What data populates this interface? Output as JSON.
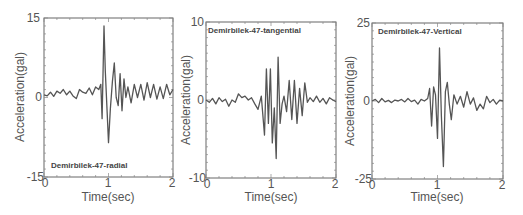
{
  "figure": {
    "background": "#ffffff",
    "line_color": "#555555"
  },
  "chart_data": [
    {
      "type": "line",
      "title": "Demirbilek-47-radial",
      "title_position": "bottom-left",
      "xlabel": "Time(sec)",
      "ylabel": "Acceleration(gal)",
      "xlim": [
        0,
        2
      ],
      "ylim": [
        -15,
        15
      ],
      "xticks": [
        "0",
        "1",
        "2"
      ],
      "yticks": [
        "-15",
        "0",
        "15"
      ],
      "grid": false,
      "x": [
        0.0,
        0.05,
        0.1,
        0.15,
        0.2,
        0.25,
        0.3,
        0.35,
        0.4,
        0.45,
        0.5,
        0.55,
        0.6,
        0.65,
        0.7,
        0.75,
        0.8,
        0.85,
        0.88,
        0.9,
        0.93,
        0.95,
        0.98,
        1.0,
        1.03,
        1.06,
        1.09,
        1.12,
        1.15,
        1.18,
        1.21,
        1.24,
        1.27,
        1.3,
        1.35,
        1.4,
        1.45,
        1.5,
        1.55,
        1.6,
        1.65,
        1.7,
        1.75,
        1.8,
        1.85,
        1.9,
        1.95,
        2.0
      ],
      "y": [
        0.5,
        0.3,
        1.0,
        0.2,
        1.2,
        0.8,
        1.5,
        0.5,
        1.2,
        0.3,
        -0.2,
        1.5,
        1.0,
        0.8,
        1.8,
        0.5,
        2.0,
        1.5,
        2.5,
        -4.0,
        13.5,
        5.0,
        -3.0,
        -8.5,
        -2.0,
        3.0,
        6.5,
        0.0,
        -1.5,
        4.5,
        -2.5,
        3.5,
        0.0,
        2.0,
        -1.0,
        2.5,
        0.0,
        2.5,
        -0.5,
        2.8,
        0.0,
        2.5,
        -0.3,
        2.0,
        -0.2,
        2.5,
        0.5,
        1.5
      ]
    },
    {
      "type": "line",
      "title": "Demirbilek-47-tangential",
      "title_position": "top-left",
      "xlabel": "Time(sec)",
      "ylabel": "Acceleration(gal)",
      "xlim": [
        0,
        2
      ],
      "ylim": [
        -10,
        10
      ],
      "xticks": [
        "0",
        "1",
        "2"
      ],
      "yticks": [
        "-10",
        "0",
        "10"
      ],
      "grid": false,
      "x": [
        0.0,
        0.05,
        0.1,
        0.15,
        0.2,
        0.25,
        0.3,
        0.35,
        0.4,
        0.45,
        0.5,
        0.55,
        0.6,
        0.65,
        0.7,
        0.75,
        0.8,
        0.85,
        0.9,
        0.93,
        0.96,
        0.99,
        1.02,
        1.05,
        1.08,
        1.11,
        1.14,
        1.17,
        1.2,
        1.24,
        1.28,
        1.32,
        1.36,
        1.4,
        1.44,
        1.48,
        1.52,
        1.56,
        1.6,
        1.65,
        1.7,
        1.75,
        1.8,
        1.85,
        1.9,
        1.95,
        2.0
      ],
      "y": [
        0.0,
        -0.3,
        0.2,
        -0.5,
        0.3,
        -0.2,
        0.1,
        -0.8,
        0.0,
        -0.3,
        0.8,
        0.3,
        0.5,
        0.0,
        0.3,
        -0.5,
        -1.2,
        0.5,
        -4.5,
        4.0,
        -3.0,
        4.0,
        -5.5,
        -1.0,
        -7.5,
        5.5,
        -3.0,
        -0.5,
        0.5,
        -1.5,
        2.5,
        -2.5,
        2.5,
        -3.0,
        1.5,
        -2.0,
        2.2,
        -0.3,
        0.3,
        -0.2,
        0.5,
        -0.3,
        0.2,
        -0.5,
        0.3,
        0.0,
        -0.2
      ]
    },
    {
      "type": "line",
      "title": "Demirbilek-47-Vertical",
      "title_position": "top-left",
      "xlabel": "Time(sec)",
      "ylabel": "Acceleration(gal)",
      "xlim": [
        0,
        2
      ],
      "ylim": [
        -25,
        25
      ],
      "xticks": [
        "0",
        "1",
        "2"
      ],
      "yticks": [
        "-25",
        "0",
        "25"
      ],
      "grid": false,
      "x": [
        0.0,
        0.05,
        0.1,
        0.15,
        0.2,
        0.25,
        0.3,
        0.35,
        0.4,
        0.45,
        0.5,
        0.55,
        0.6,
        0.65,
        0.7,
        0.75,
        0.8,
        0.85,
        0.88,
        0.91,
        0.94,
        0.97,
        1.0,
        1.03,
        1.06,
        1.09,
        1.12,
        1.15,
        1.18,
        1.21,
        1.25,
        1.3,
        1.35,
        1.4,
        1.45,
        1.5,
        1.55,
        1.6,
        1.65,
        1.7,
        1.75,
        1.8,
        1.85,
        1.9,
        1.95,
        2.0
      ],
      "y": [
        0.0,
        0.5,
        -0.5,
        0.8,
        -0.3,
        0.2,
        -0.5,
        0.3,
        0.0,
        0.5,
        -0.3,
        0.8,
        -0.2,
        0.3,
        -1.0,
        0.5,
        0.0,
        0.8,
        4.0,
        -8.0,
        4.5,
        2.0,
        -12.0,
        17.0,
        -5.0,
        -21.0,
        3.0,
        6.0,
        -1.0,
        -6.0,
        2.0,
        -1.0,
        1.5,
        -2.0,
        3.0,
        -1.0,
        1.0,
        -3.0,
        -1.0,
        -2.5,
        1.5,
        -0.5,
        0.5,
        -1.0,
        0.3,
        0.0
      ]
    }
  ],
  "panels": [
    {
      "title": "Demirbilek-47-radial",
      "xlabel": "Time(sec)",
      "ylabel": "Acceleration(gal)",
      "ytop": "15",
      "ymid": "0",
      "ybot": "-15",
      "x0": "0",
      "x1": "1",
      "x2": "2"
    },
    {
      "title": "Demirbilek-47-tangential",
      "xlabel": "Time(sec)",
      "ylabel": "Acceleration(gal)",
      "ytop": "10",
      "ymid": "0",
      "ybot": "-10",
      "x0": "0",
      "x1": "1",
      "x2": "2"
    },
    {
      "title": "Demirbilek-47-Vertical",
      "xlabel": "Time(sec)",
      "ylabel": "Acceleration(gal)",
      "ytop": "25",
      "ymid": "0",
      "ybot": "-25",
      "x0": "0",
      "x1": "1",
      "x2": "2"
    }
  ]
}
